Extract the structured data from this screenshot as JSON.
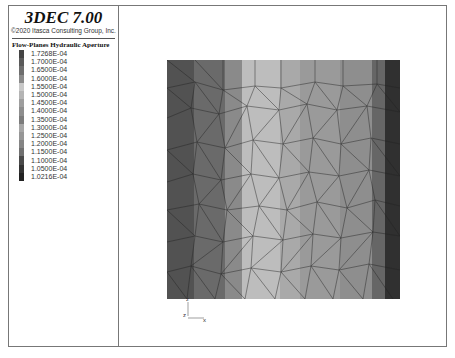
{
  "header": {
    "title": "3DEC 7.00",
    "copyright": "©2020 Itasca Consulting Group, Inc."
  },
  "legend": {
    "title": "Flow-Planes Hydraulic Aperture",
    "items": [
      {
        "label": "1.7268E-04",
        "color": "#444444"
      },
      {
        "label": "1.7000E-04",
        "color": "#5a5a5a"
      },
      {
        "label": "1.6500E-04",
        "color": "#6e6e6e"
      },
      {
        "label": "1.6000E-04",
        "color": "#8a8a8a"
      },
      {
        "label": "1.5500E-04",
        "color": "#c8c8c8"
      },
      {
        "label": "1.5000E-04",
        "color": "#b4b4b4"
      },
      {
        "label": "1.4500E-04",
        "color": "#9e9e9e"
      },
      {
        "label": "1.4000E-04",
        "color": "#8e8e8e"
      },
      {
        "label": "1.3500E-04",
        "color": "#7c7c7c"
      },
      {
        "label": "1.3000E-04",
        "color": "#a6a6a6"
      },
      {
        "label": "1.2500E-04",
        "color": "#969696"
      },
      {
        "label": "1.2000E-04",
        "color": "#858585"
      },
      {
        "label": "1.1500E-04",
        "color": "#707070"
      },
      {
        "label": "1.1000E-04",
        "color": "#4a4a4a"
      },
      {
        "label": "1.0500E-04",
        "color": "#333333"
      },
      {
        "label": "1.0216E-04",
        "color": "#222222"
      }
    ]
  },
  "plot": {
    "bands": [
      {
        "x": 0,
        "w": 27,
        "color": "#525252"
      },
      {
        "x": 27,
        "w": 31,
        "color": "#6a6a6a"
      },
      {
        "x": 58,
        "w": 17,
        "color": "#8a8a8a"
      },
      {
        "x": 75,
        "w": 38,
        "color": "#bdbdbd"
      },
      {
        "x": 113,
        "w": 20,
        "color": "#a9a9a9"
      },
      {
        "x": 133,
        "w": 40,
        "color": "#9a9a9a"
      },
      {
        "x": 173,
        "w": 32,
        "color": "#8e8e8e"
      },
      {
        "x": 205,
        "w": 13,
        "color": "#666666"
      },
      {
        "x": 218,
        "w": 15,
        "color": "#303030"
      }
    ]
  },
  "axes": {
    "z_label": "z",
    "x_label": "x",
    "origin_label": "z"
  }
}
